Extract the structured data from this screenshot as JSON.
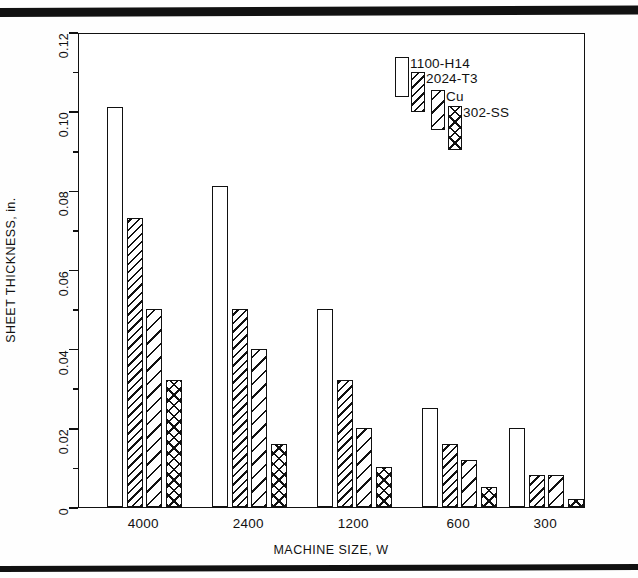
{
  "figure": {
    "rules": [
      "top-rule",
      "bottom-rule"
    ]
  },
  "axes": {
    "y_title": "SHEET THICKNESS, in.",
    "x_title": "MACHINE SIZE, W",
    "y_major_ticks": [
      "0",
      "0.02",
      "0.04",
      "0.06",
      "0.08",
      "0.10",
      "0.12"
    ],
    "y_minor_ticks": [
      "0.01",
      "0.03",
      "0.05",
      "0.07",
      "0.09",
      "0.11"
    ],
    "x_group_labels": [
      "4000",
      "2400",
      "1200",
      "600",
      "300"
    ]
  },
  "legend": {
    "items": [
      {
        "label": "1100-H14",
        "pattern": "pat-empty"
      },
      {
        "label": "2024-T3",
        "pattern": "pat-hatch-dense"
      },
      {
        "label": "Cu",
        "pattern": "pat-hatch-sparse"
      },
      {
        "label": "302-SS",
        "pattern": "pat-cross"
      }
    ]
  },
  "chart_data": {
    "type": "bar",
    "title": "",
    "xlabel": "MACHINE SIZE, W",
    "ylabel": "SHEET THICKNESS, in.",
    "categories": [
      "4000",
      "2400",
      "1200",
      "600",
      "300"
    ],
    "ylim": [
      0,
      0.12
    ],
    "ytick_step": 0.02,
    "yminor_step": 0.01,
    "grid": false,
    "legend_position": "upper-right-inside",
    "series": [
      {
        "name": "1100-H14",
        "pattern": "pat-empty",
        "values": [
          0.101,
          0.081,
          0.05,
          0.025,
          0.02
        ]
      },
      {
        "name": "2024-T3",
        "pattern": "pat-hatch-dense",
        "values": [
          0.073,
          0.05,
          0.032,
          0.016,
          0.008
        ]
      },
      {
        "name": "Cu",
        "pattern": "pat-hatch-sparse",
        "values": [
          0.05,
          0.04,
          0.02,
          0.012,
          0.008
        ]
      },
      {
        "name": "302-SS",
        "pattern": "pat-cross",
        "values": [
          0.032,
          0.016,
          0.01,
          0.005,
          0.002
        ]
      }
    ]
  }
}
